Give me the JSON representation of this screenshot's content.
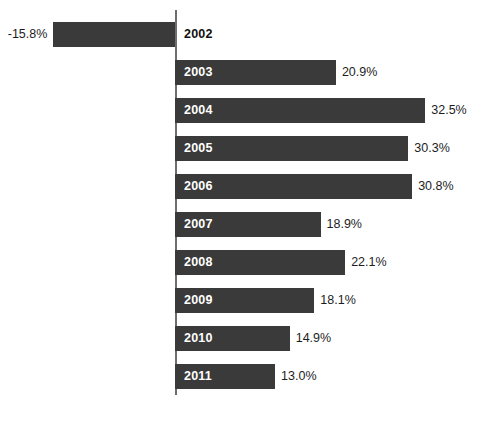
{
  "chart_data": {
    "type": "bar",
    "orientation": "horizontal",
    "title": "",
    "subtitle": "",
    "xlabel": "",
    "ylabel": "",
    "grid": false,
    "legend": null,
    "axis_zero_line": true,
    "unit": "%",
    "categories": [
      "2002",
      "2003",
      "2004",
      "2005",
      "2006",
      "2007",
      "2008",
      "2009",
      "2010",
      "2011"
    ],
    "values": [
      -15.8,
      20.9,
      32.5,
      30.3,
      30.8,
      18.9,
      22.1,
      18.1,
      14.9,
      13.0
    ],
    "value_labels": [
      "-15.8%",
      "20.9%",
      "32.5%",
      "30.3%",
      "30.8%",
      "18.9%",
      "22.1%",
      "18.1%",
      "14.9%",
      "13.0%"
    ],
    "xlim": [
      -15.8,
      32.5
    ],
    "bars": [
      {
        "category": "2002",
        "value": -15.8,
        "value_label": "-15.8%",
        "label_position": "outside-right",
        "value_label_position": "left"
      },
      {
        "category": "2003",
        "value": 20.9,
        "value_label": "20.9%",
        "label_position": "inside",
        "value_label_position": "right"
      },
      {
        "category": "2004",
        "value": 32.5,
        "value_label": "32.5%",
        "label_position": "inside",
        "value_label_position": "right"
      },
      {
        "category": "2005",
        "value": 30.3,
        "value_label": "30.3%",
        "label_position": "inside",
        "value_label_position": "right"
      },
      {
        "category": "2006",
        "value": 30.8,
        "value_label": "30.8%",
        "label_position": "inside",
        "value_label_position": "right"
      },
      {
        "category": "2007",
        "value": 18.9,
        "value_label": "18.9%",
        "label_position": "inside",
        "value_label_position": "right"
      },
      {
        "category": "2008",
        "value": 22.1,
        "value_label": "22.1%",
        "label_position": "inside",
        "value_label_position": "right"
      },
      {
        "category": "2009",
        "value": 18.1,
        "value_label": "18.1%",
        "label_position": "inside",
        "value_label_position": "right"
      },
      {
        "category": "2010",
        "value": 14.9,
        "value_label": "14.9%",
        "label_position": "inside",
        "value_label_position": "right"
      },
      {
        "category": "2011",
        "value": 13.0,
        "value_label": "13.0%",
        "label_position": "inside",
        "value_label_position": "right"
      }
    ],
    "colors": {
      "bar": "#3a3a3a",
      "background": "#ffffff",
      "axis": "#6e6e6e",
      "label_inside": "#ffffff",
      "label_outside": "#111111",
      "value_text": "#1d1d1d"
    },
    "geometry": {
      "axis_x": 175,
      "axis_top": 10,
      "axis_bottom": 395,
      "bar_height": 25,
      "bar_pitch": 38,
      "first_bar_top": 22,
      "px_per_percent": 7.7
    }
  }
}
